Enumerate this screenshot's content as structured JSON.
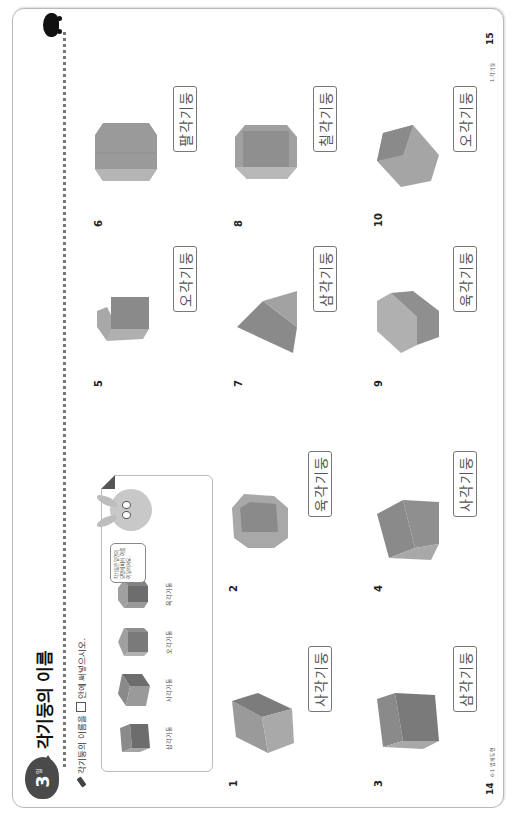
{
  "page": {
    "badge": {
      "number": "3",
      "suffix": "일"
    },
    "title": "각기둥의 이름",
    "instruction": {
      "before": "각기둥의 이름을",
      "after": "안에 써넣으시오."
    },
    "reference": {
      "items": [
        {
          "label": "삼각기둥",
          "shape": "triangular-prism"
        },
        {
          "label": "사각기둥",
          "shape": "square-prism"
        },
        {
          "label": "오각기둥",
          "shape": "pentagonal-prism"
        },
        {
          "label": "육각기둥",
          "shape": "hexagonal-prism"
        }
      ],
      "bubble_text": "각기둥은 밑면의 모양에 따라 이름이 달라져요."
    },
    "problems": [
      {
        "number": "1",
        "answer": "사각기둥"
      },
      {
        "number": "2",
        "answer": "육각기둥"
      },
      {
        "number": "3",
        "answer": "삼각기둥"
      },
      {
        "number": "4",
        "answer": "사각기둥"
      },
      {
        "number": "5",
        "answer": "오각기둥"
      },
      {
        "number": "6",
        "answer": "팔각기둥"
      },
      {
        "number": "7",
        "answer": "삼각기둥"
      },
      {
        "number": "8",
        "answer": "칠각기둥"
      },
      {
        "number": "9",
        "answer": "육각기둥"
      },
      {
        "number": "10",
        "answer": "오각기둥"
      }
    ],
    "footer_left": {
      "page": "14",
      "text": "6-1 입체도형"
    },
    "footer_right": {
      "page": "15",
      "text": "1.각기둥"
    }
  },
  "colors": {
    "badge": "#4a4a4a",
    "shape_dark": "#7a7a7a",
    "shape_mid": "#9a9a9a",
    "shape_light": "#bdbdbd",
    "border": "#b8b8b8"
  }
}
